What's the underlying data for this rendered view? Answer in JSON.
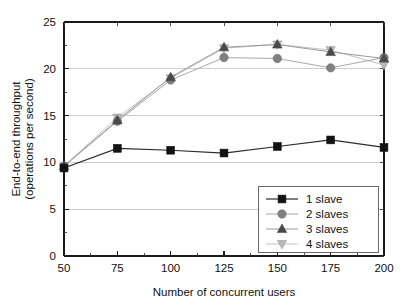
{
  "chart_data": {
    "type": "line",
    "title": "",
    "xlabel": "Number of concurrent users",
    "ylabel_line1": "End-to-end throughput",
    "ylabel_line2": "(operations per second)",
    "x": [
      50,
      75,
      100,
      125,
      150,
      175,
      200
    ],
    "xticklabels": [
      "50",
      "75",
      "100",
      "125",
      "150",
      "175",
      "200"
    ],
    "yticklabels": [
      "0",
      "5",
      "10",
      "15",
      "20",
      "25"
    ],
    "yticks": [
      0,
      5,
      10,
      15,
      20,
      25
    ],
    "xlim": [
      50,
      200
    ],
    "ylim": [
      0,
      25
    ],
    "grid": "horizontal",
    "legend_position": "lower-right",
    "series": [
      {
        "name": "1 slave",
        "marker": "square",
        "color": "#121212",
        "line_color": "#2b2b2b",
        "values": [
          9.4,
          11.5,
          11.3,
          11.0,
          11.7,
          12.4,
          11.6
        ]
      },
      {
        "name": "2 slaves",
        "marker": "circle",
        "color": "#808080",
        "line_color": "#a8a8a8",
        "values": [
          9.6,
          14.4,
          18.8,
          21.2,
          21.1,
          20.1,
          21.2
        ]
      },
      {
        "name": "3 slaves",
        "marker": "triangle-up",
        "color": "#4a4a4a",
        "line_color": "#9a9a9a",
        "values": [
          9.6,
          14.5,
          19.1,
          22.3,
          22.6,
          21.8,
          21.1
        ]
      },
      {
        "name": "4 slaves",
        "marker": "triangle-down",
        "color": "#b8b8b8",
        "line_color": "#c4c4c4",
        "values": [
          9.6,
          14.8,
          19.0,
          22.2,
          22.6,
          22.0,
          20.4
        ]
      }
    ]
  }
}
